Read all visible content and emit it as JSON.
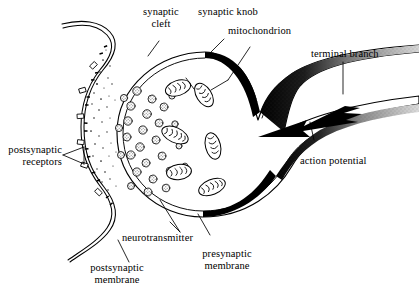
{
  "figure": {
    "background_color": "#ffffff",
    "ink_color": "#000000"
  },
  "labels": {
    "synaptic_cleft": "synaptic\ncleft",
    "synaptic_knob": "synaptic knob",
    "mitochondrion": "mitochondrion",
    "terminal_branch": "terminal branch",
    "action_potential": "action potential",
    "postsynaptic_receptors": "postsynaptic\nreceptors",
    "neurotransmitter": "neurotransmitter",
    "postsynaptic_membrane": "postsynaptic\nmembrane",
    "presynaptic_membrane": "presynaptic\nmembrane"
  },
  "structures": {
    "synaptic_knob": "large rounded terminal bouton containing vesicles and mitochondria",
    "presynaptic_membrane": "membrane of the knob, solid black at active zones fading to stipple along the axon",
    "postsynaptic_membrane": "wavy double-lined membrane at the left bearing receptor blocks",
    "synaptic_cleft": "narrow gap between presynaptic and postsynaptic membranes containing neurotransmitter dots",
    "terminal_branch": "axon terminal branch entering from the right",
    "action_potential": "thick jagged arrow travelling leftward along the axon toward the knob"
  },
  "counts": {
    "vesicles": 23,
    "mitochondria": 6,
    "receptor_blocks": 6,
    "fusing_vesicles": 4
  }
}
